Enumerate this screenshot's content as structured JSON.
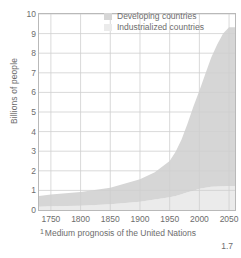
{
  "chart_data": {
    "type": "area",
    "title": "",
    "subtitle": "",
    "xlabel": "",
    "ylabel": "Billions of people",
    "xlim": [
      1730,
      2060
    ],
    "ylim": [
      0,
      10
    ],
    "grid": true,
    "stacked": true,
    "legend_position": "top-right",
    "xticks": [
      1750,
      1800,
      1850,
      1900,
      1950,
      2000,
      2050
    ],
    "xtick_labels": [
      "1750",
      "1800",
      "1850",
      "1900",
      "1950",
      "2000",
      "2050"
    ],
    "yticks": [
      0,
      1,
      2,
      3,
      4,
      5,
      6,
      7,
      8,
      9,
      10
    ],
    "ytick_labels": [
      "0",
      "1",
      "2",
      "3",
      "4",
      "5",
      "6",
      "7",
      "8",
      "9",
      "10"
    ],
    "x": [
      1730,
      1750,
      1800,
      1850,
      1900,
      1925,
      1950,
      1960,
      1970,
      1980,
      1990,
      2000,
      2010,
      2020,
      2030,
      2040,
      2050,
      2060
    ],
    "series": [
      {
        "name": "Industrialized countries",
        "color": "#ebebeb",
        "values": [
          0.17,
          0.19,
          0.22,
          0.29,
          0.42,
          0.53,
          0.65,
          0.72,
          0.8,
          0.9,
          0.98,
          1.08,
          1.14,
          1.18,
          1.2,
          1.21,
          1.22,
          1.22
        ]
      },
      {
        "name": "Developing countries",
        "color": "#d6d6d6",
        "values": [
          0.55,
          0.6,
          0.7,
          0.85,
          1.15,
          1.4,
          1.85,
          2.25,
          2.8,
          3.5,
          4.3,
          5.0,
          5.8,
          6.6,
          7.25,
          7.8,
          8.1,
          8.1
        ]
      }
    ],
    "total": [
      0.72,
      0.79,
      0.92,
      1.14,
      1.57,
      1.93,
      2.5,
      2.97,
      3.6,
      4.4,
      5.28,
      6.08,
      6.94,
      7.78,
      8.45,
      9.01,
      9.32,
      9.32
    ],
    "annotations": [
      {
        "text": "Medium prognosis of the United Nations",
        "marker": "¹"
      }
    ],
    "figure_number": "1.7",
    "grid_color": "#cfcfcf",
    "frame_color": "#b9b9b9",
    "text_color": "#6d6d6d"
  },
  "legend": {
    "items": [
      {
        "label": "Developing countries",
        "color": "#d6d6d6"
      },
      {
        "label": "Industrialized countries",
        "color": "#ebebeb"
      }
    ]
  },
  "footnote": {
    "marker": "1",
    "text": "Medium prognosis of the United Nations"
  },
  "figure": {
    "number": "1.7"
  }
}
